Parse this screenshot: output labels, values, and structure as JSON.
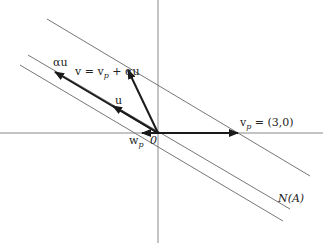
{
  "diagram": {
    "labels": {
      "alpha_u": "αu",
      "v_eq": "v = v",
      "v_eq_sub": "p",
      "v_eq_rest": " + αu",
      "u": "u",
      "vp": "v",
      "vp_sub": "p",
      "vp_rest": " = (3,0)",
      "wp": "w",
      "wp_sub": "p",
      "origin": "0",
      "null_space": "N(A)"
    },
    "colors": {
      "axis": "#888888",
      "line": "#777777",
      "arrow": "#1a1a1a"
    }
  }
}
